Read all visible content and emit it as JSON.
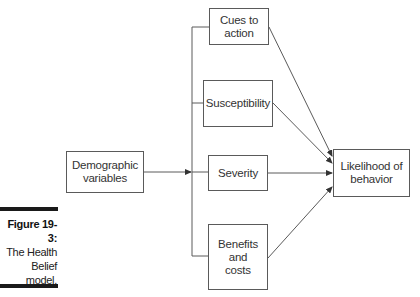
{
  "figure": {
    "label": "Figure 19-3:",
    "caption_lines": [
      "The Health",
      "Belief",
      "model."
    ]
  },
  "nodes": {
    "demographic": {
      "line1": "Demographic",
      "line2": "variables"
    },
    "cues": {
      "line1": "Cues to",
      "line2": "action"
    },
    "susceptibility": {
      "line1": "Susceptibility"
    },
    "severity": {
      "line1": "Severity"
    },
    "benefits": {
      "line1": "Benefits",
      "line2": "and",
      "line3": "costs"
    },
    "likelihood": {
      "line1": "Likelihood of",
      "line2": "behavior"
    }
  },
  "edges": [
    {
      "from": "demographic",
      "to": "branch"
    },
    {
      "from": "branch",
      "to": "cues"
    },
    {
      "from": "branch",
      "to": "susceptibility"
    },
    {
      "from": "branch",
      "to": "severity"
    },
    {
      "from": "branch",
      "to": "benefits"
    },
    {
      "from": "cues",
      "to": "likelihood"
    },
    {
      "from": "susceptibility",
      "to": "likelihood"
    },
    {
      "from": "severity",
      "to": "likelihood"
    },
    {
      "from": "benefits",
      "to": "likelihood"
    }
  ],
  "colors": {
    "line": "#5a5a5a",
    "bar": "#1a1a1a"
  }
}
